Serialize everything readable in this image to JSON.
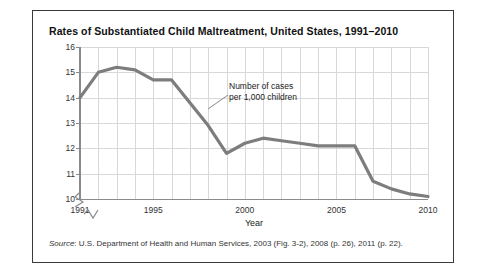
{
  "figure": {
    "title": "Rates of Substantiated Child Maltreatment, United States, 1991–2010",
    "source_prefix": "Source",
    "source_text": ": U.S. Department of Health and Human Services, 2003 (Fig. 3-2), 2008 (p. 26), 2011 (p. 22)."
  },
  "annotation": {
    "line1": "Number of cases",
    "line2": "per 1,000 children"
  },
  "chart_data": {
    "type": "line",
    "title": "Rates of Substantiated Child Maltreatment, United States, 1991–2010",
    "xlabel": "Year",
    "ylabel": "",
    "x": [
      1991,
      1992,
      1993,
      1994,
      1995,
      1996,
      1997,
      1998,
      1999,
      2000,
      2001,
      2002,
      2003,
      2004,
      2005,
      2006,
      2007,
      2008,
      2009,
      2010
    ],
    "values": [
      14.0,
      15.0,
      15.2,
      15.1,
      14.7,
      14.7,
      13.8,
      12.9,
      11.8,
      12.2,
      12.4,
      12.3,
      12.2,
      12.1,
      12.1,
      12.1,
      10.7,
      10.4,
      10.2,
      10.1
    ],
    "series": [
      {
        "name": "Number of cases per 1,000 children",
        "values": [
          14.0,
          15.0,
          15.2,
          15.1,
          14.7,
          14.7,
          13.8,
          12.9,
          11.8,
          12.2,
          12.4,
          12.3,
          12.2,
          12.1,
          12.1,
          12.1,
          10.7,
          10.4,
          10.2,
          10.1
        ]
      }
    ],
    "xlim": [
      1991,
      2010
    ],
    "ylim": [
      10,
      16
    ],
    "yticks": [
      10,
      11,
      12,
      13,
      14,
      15,
      16
    ],
    "xticks": [
      1991,
      1995,
      2000,
      2005,
      2010
    ],
    "grid": true,
    "legend": "none",
    "axis_break": true,
    "line_color": "#7d7d7d",
    "grid_color": "#d8d8d8",
    "axis_color": "#8a8a8a"
  }
}
